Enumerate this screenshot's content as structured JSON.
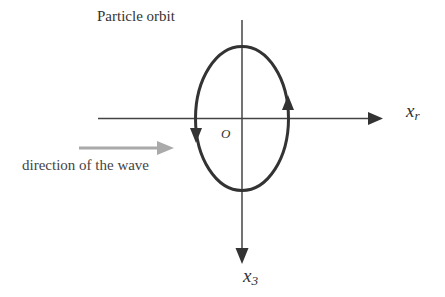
{
  "diagram": {
    "title": "Particle orbit",
    "axes": {
      "horizontal": {
        "label": "x",
        "subscript": "r"
      },
      "vertical": {
        "label": "x",
        "subscript": "3"
      },
      "origin": "O"
    },
    "wave_direction_label": "direction of the wave",
    "orbit": {
      "shape": "ellipse",
      "rotation": "counter-clockwise as drawn (up on right, down on left)"
    },
    "colors": {
      "lines": "#333333",
      "wave_arrow": "#aaaaaa",
      "text": "#333333"
    }
  }
}
